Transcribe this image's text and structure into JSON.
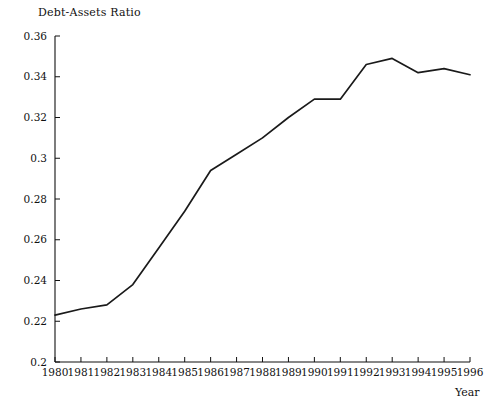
{
  "chart_data": {
    "type": "line",
    "title": "Debt-Assets Ratio",
    "xlabel": "Year",
    "ylabel": "",
    "grid": false,
    "legend": "none",
    "xlim": [
      1980,
      1996
    ],
    "ylim": [
      0.2,
      0.36
    ],
    "x_ticks": [
      1980,
      1981,
      1982,
      1983,
      1984,
      1985,
      1986,
      1987,
      1988,
      1989,
      1990,
      1991,
      1992,
      1993,
      1994,
      1995,
      1996
    ],
    "x_tick_labels": [
      "1980",
      "1981",
      "1982",
      "1983",
      "1984",
      "1985",
      "1986",
      "1987",
      "1988",
      "1989",
      "1990",
      "1991",
      "1992",
      "1993",
      "1994",
      "1995",
      "1996"
    ],
    "y_ticks": [
      0.2,
      0.22,
      0.24,
      0.26,
      0.28,
      0.3,
      0.32,
      0.34,
      0.36
    ],
    "y_tick_labels": [
      "0.2",
      "0.22",
      "0.24",
      "0.26",
      "0.28",
      "0.3",
      "0.32",
      "0.34",
      "0.36"
    ],
    "series": [
      {
        "name": "Debt-Assets Ratio",
        "color": "#1a1a1a",
        "x": [
          1980,
          1981,
          1982,
          1983,
          1984,
          1985,
          1986,
          1987,
          1988,
          1989,
          1990,
          1991,
          1992,
          1993,
          1994,
          1995,
          1996
        ],
        "values": [
          0.223,
          0.226,
          0.228,
          0.238,
          0.256,
          0.274,
          0.294,
          0.302,
          0.31,
          0.32,
          0.329,
          0.329,
          0.346,
          0.349,
          0.342,
          0.344,
          0.341
        ]
      }
    ]
  },
  "axis_title": {
    "y": "Debt-Assets Ratio",
    "x": "Year"
  },
  "colors": {
    "line": "#1a1a1a",
    "axis": "#111111",
    "background": "#ffffff"
  }
}
